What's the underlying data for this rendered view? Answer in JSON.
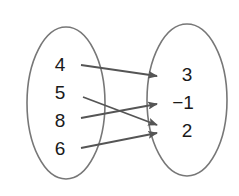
{
  "diagram": {
    "type": "mapping",
    "domain": {
      "values": [
        "4",
        "5",
        "8",
        "6"
      ]
    },
    "range": {
      "values": [
        "3",
        "−1",
        "2"
      ]
    },
    "mappings": [
      {
        "from": "4",
        "to": "3"
      },
      {
        "from": "5",
        "to": "2"
      },
      {
        "from": "8",
        "to": "−1"
      },
      {
        "from": "6",
        "to": "2"
      }
    ],
    "colors": {
      "ellipse_stroke": "#777777",
      "arrow": "#555555",
      "text": "#1a1a1a"
    }
  }
}
